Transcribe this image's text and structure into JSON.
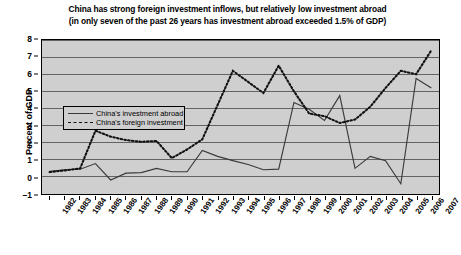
{
  "chart_data": {
    "type": "line",
    "title": "China has strong foreign investment inflows, but relatively low investment abroad (in only seven of the past 26 years has investment abroad exceeded 1.5% of GDP)",
    "title_line1": "China has strong foreign investment inflows, but relatively low investment abroad",
    "title_line2": "(in only seven of the past 26 years has investment abroad exceeded 1.5% of GDP)",
    "xlabel": "",
    "ylabel": "Percent of GDP",
    "ylim": [
      -1,
      8
    ],
    "yticks": [
      -1,
      0,
      1,
      2,
      3,
      4,
      5,
      6,
      7,
      8
    ],
    "ytick_labels": [
      "–1",
      "0",
      "1",
      "2",
      "3",
      "4",
      "5",
      "6",
      "7",
      "8"
    ],
    "grid": "horizontal",
    "legend_position": "upper-left-inside",
    "categories": [
      "1982",
      "1983",
      "1984",
      "1985",
      "1986",
      "1987",
      "1988",
      "1989",
      "1990",
      "1991",
      "1992",
      "1993",
      "1994",
      "1995",
      "1996",
      "1997",
      "1998",
      "1999",
      "2000",
      "2001",
      "2002",
      "2003",
      "2004",
      "2005",
      "2006",
      "2007"
    ],
    "series": [
      {
        "name": "China's investment abroad",
        "style": "solid",
        "color": "#3a3a3a",
        "values": [
          0.32,
          0.42,
          0.45,
          0.78,
          -0.18,
          0.22,
          0.25,
          0.5,
          0.3,
          0.3,
          1.55,
          1.2,
          0.95,
          0.72,
          0.42,
          0.45,
          4.35,
          3.95,
          3.3,
          4.75,
          0.5,
          1.2,
          0.95,
          -0.4,
          5.75,
          5.2
        ]
      },
      {
        "name": "China's foreign investment",
        "style": "dashed",
        "color": "#111111",
        "values": [
          0.28,
          0.38,
          0.5,
          2.7,
          2.35,
          2.15,
          2.05,
          2.1,
          1.1,
          1.6,
          2.2,
          4.2,
          6.2,
          5.55,
          4.9,
          6.5,
          5.0,
          3.7,
          3.55,
          3.15,
          3.35,
          4.1,
          5.2,
          6.2,
          6.0,
          7.4
        ]
      }
    ]
  },
  "legend": {
    "items": [
      {
        "label": "China's investment abroad",
        "style": "solid"
      },
      {
        "label": "China's foreign investment",
        "style": "dashed"
      }
    ]
  }
}
